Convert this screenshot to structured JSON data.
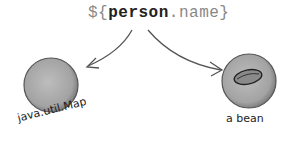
{
  "expression": {
    "prefix": "${",
    "object": "person",
    "dot": ".",
    "property": "name",
    "suffix": "}"
  },
  "nodes": [
    {
      "label": "java.util.Map",
      "icon": "sphere"
    },
    {
      "label": "a bean",
      "icon": "bean-in-sphere"
    }
  ],
  "colors": {
    "sphere": "#9a9a9a",
    "arrow": "#555555"
  }
}
